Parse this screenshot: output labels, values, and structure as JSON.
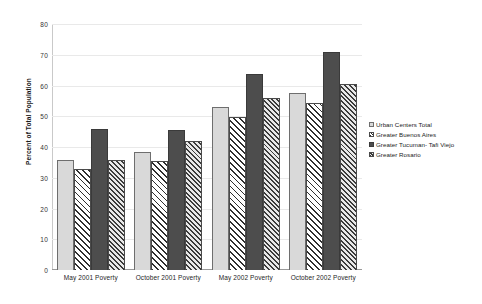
{
  "chart_data": {
    "type": "bar",
    "title": "",
    "xlabel": "",
    "ylabel": "Percent of Total Population",
    "ylim": [
      0,
      80
    ],
    "yticks": [
      0,
      10,
      20,
      30,
      40,
      50,
      60,
      70,
      80
    ],
    "grid": true,
    "legend_position": "right",
    "categories": [
      "May 2001 Poverty",
      "October 2001 Poverty",
      "May 2002 Poverty",
      "October 2002 Poverty"
    ],
    "series": [
      {
        "name": "Urban Centers Total",
        "pattern": "solid-light",
        "values": [
          35.9,
          38.3,
          53.0,
          57.5
        ]
      },
      {
        "name": "Greater Buenos Aires",
        "pattern": "diagonal-hatch",
        "values": [
          32.7,
          35.4,
          49.7,
          54.3
        ]
      },
      {
        "name": "Greater Tucuman- Tafi Viejo",
        "pattern": "solid-dark",
        "values": [
          46.0,
          45.6,
          63.6,
          70.8
        ]
      },
      {
        "name": "Greater Rosario",
        "pattern": "dense-hatch",
        "values": [
          35.8,
          42.0,
          55.9,
          60.5
        ]
      }
    ]
  },
  "colors": {
    "series_1": "#d9d9d9",
    "series_2": "#ffffff",
    "series_3": "#4d4d4d",
    "series_4": "#e8e8e8",
    "gridline": "#e9e9e9",
    "axis": "#9a9a9a",
    "text": "#1a1a1a",
    "background": "#ffffff"
  }
}
